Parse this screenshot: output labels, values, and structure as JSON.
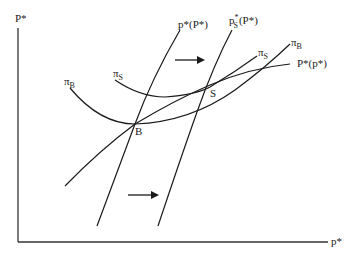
{
  "diagram": {
    "type": "economic-equilibrium-diagram",
    "axes": {
      "y_label": "P*",
      "x_label": "p*"
    },
    "curves": [
      {
        "id": "p_star_of_P_star",
        "label": "p*(P*)",
        "label_main": "p*(P*)"
      },
      {
        "id": "p_S_star_of_P_star",
        "label": "p*S(P*)",
        "label_base": "p",
        "label_sup": "*",
        "label_sub": "S",
        "label_rest": "(P*)"
      },
      {
        "id": "pi_B_curve",
        "label": "πB",
        "label_base": "π",
        "label_sub": "B"
      },
      {
        "id": "pi_S_curve",
        "label": "πS",
        "label_base": "π",
        "label_sub": "S"
      },
      {
        "id": "P_star_of_p_star",
        "label": "P*(p*)"
      }
    ],
    "curve_labels_right": {
      "pi_S": {
        "base": "π",
        "sub": "S"
      },
      "pi_B": {
        "base": "π",
        "sub": "B"
      },
      "P_star_of_p_star": "P*(p*)"
    },
    "points": [
      {
        "id": "B",
        "label": "B"
      },
      {
        "id": "S",
        "label": "S"
      }
    ],
    "arrows": [
      {
        "id": "shift-arrow-top",
        "direction": "right"
      },
      {
        "id": "shift-arrow-bottom",
        "direction": "right"
      }
    ],
    "colors": {
      "line": "#1a1a1a",
      "axis": "#333333",
      "background": "#ffffff"
    }
  }
}
